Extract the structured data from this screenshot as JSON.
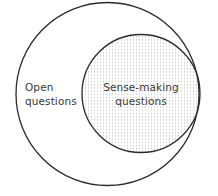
{
  "diagram": {
    "type": "nested-venn",
    "sets": [
      {
        "id": "open-questions",
        "label_lines": [
          "Open",
          "questions"
        ],
        "fill": "none",
        "contains": [
          "sense-making-questions"
        ]
      },
      {
        "id": "sense-making-questions",
        "label_lines": [
          "Sense-making",
          "questions"
        ],
        "fill": "dotted-pattern"
      }
    ],
    "colors": {
      "stroke": "#2b2b2b",
      "dots": "#b8b8b8",
      "text": "#3a3a3a",
      "background": "#ffffff"
    }
  }
}
